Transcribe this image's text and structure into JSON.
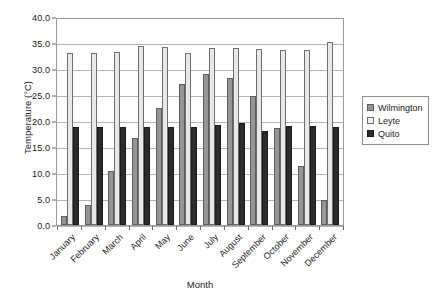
{
  "chart_data": {
    "type": "bar",
    "title": "",
    "xlabel": "Month",
    "ylabel": "Temperature (°C)",
    "ylim": [
      0.0,
      40.0
    ],
    "ytick_step": 5.0,
    "ytick_labels": [
      "40.0",
      "35.0",
      "30.0",
      "25.0",
      "20.0",
      "15.0",
      "10.0",
      "5.0",
      "0.0"
    ],
    "grid": true,
    "legend_position": "right",
    "categories": [
      "January",
      "February",
      "March",
      "April",
      "May",
      "June",
      "July",
      "August",
      "September",
      "October",
      "November",
      "December"
    ],
    "series": [
      {
        "name": "Wilmington",
        "color": "#969696",
        "values": [
          1.7,
          3.9,
          10.4,
          16.8,
          22.7,
          27.3,
          29.3,
          28.6,
          25.0,
          18.9,
          11.5,
          4.9
        ]
      },
      {
        "name": "Leyte",
        "color": "#e8e8e8",
        "values": [
          33.4,
          33.4,
          33.5,
          34.8,
          34.6,
          33.4,
          34.4,
          34.3,
          34.2,
          34.0,
          34.0,
          35.6
        ]
      },
      {
        "name": "Quito",
        "color": "#2b2b2b",
        "values": [
          19.0,
          19.0,
          19.0,
          19.0,
          19.0,
          19.1,
          19.4,
          19.8,
          18.3,
          19.2,
          19.2,
          19.0
        ]
      }
    ]
  }
}
